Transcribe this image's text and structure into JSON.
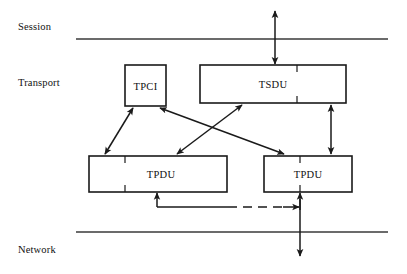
{
  "diagram": {
    "colors": {
      "stroke": "#1a1a1a",
      "text": "#111111",
      "background": "#ffffff",
      "separator": "#3a3a3a"
    },
    "layers": [
      {
        "id": "session",
        "label": "Session"
      },
      {
        "id": "transport",
        "label": "Transport"
      },
      {
        "id": "network",
        "label": "Network"
      }
    ],
    "separators": [
      {
        "id": "session-transport-line",
        "y": 39,
        "x1": 76,
        "x2": 388
      },
      {
        "id": "transport-network-line",
        "y": 232,
        "x1": 76,
        "x2": 388
      }
    ],
    "boxes": [
      {
        "id": "tpci",
        "label": "TPCI",
        "x": 125,
        "y": 65,
        "width": 41,
        "height": 41,
        "ticks": []
      },
      {
        "id": "tsdu",
        "label": "TSDU",
        "x": 200,
        "y": 65,
        "width": 146,
        "height": 38,
        "ticks": [
          297
        ]
      },
      {
        "id": "tpdu-left",
        "label": "TPDU",
        "x": 89,
        "y": 156,
        "width": 138,
        "height": 36,
        "ticks": [
          125
        ]
      },
      {
        "id": "tpdu-right",
        "label": "TPDU",
        "x": 264,
        "y": 156,
        "width": 88,
        "height": 36,
        "ticks": [
          300
        ]
      }
    ],
    "connectors": [
      {
        "id": "session-tsdu-arrow",
        "kind": "vertical-double-arrow",
        "note": "Session layer to TSDU"
      },
      {
        "id": "tpci-tpdu-left-arrow",
        "kind": "diagonal-double-arrow",
        "note": "TPCI to left TPDU"
      },
      {
        "id": "tpci-tpdu-right-arrow",
        "kind": "diagonal-double-arrow",
        "note": "TPCI to right TPDU"
      },
      {
        "id": "tsdu-tpdu-left-arrow",
        "kind": "diagonal-double-arrow",
        "note": "TSDU to left TPDU"
      },
      {
        "id": "tsdu-tpdu-right-arrow",
        "kind": "vertical-double-arrow",
        "note": "TSDU to right TPDU"
      },
      {
        "id": "tpdu-transfer-dashed",
        "kind": "dashed-horizontal-arrow",
        "note": "TPDU transfer between peers"
      },
      {
        "id": "tpdu-network-arrow",
        "kind": "vertical-arrow-down",
        "note": "Right TPDU down to Network layer"
      }
    ]
  }
}
